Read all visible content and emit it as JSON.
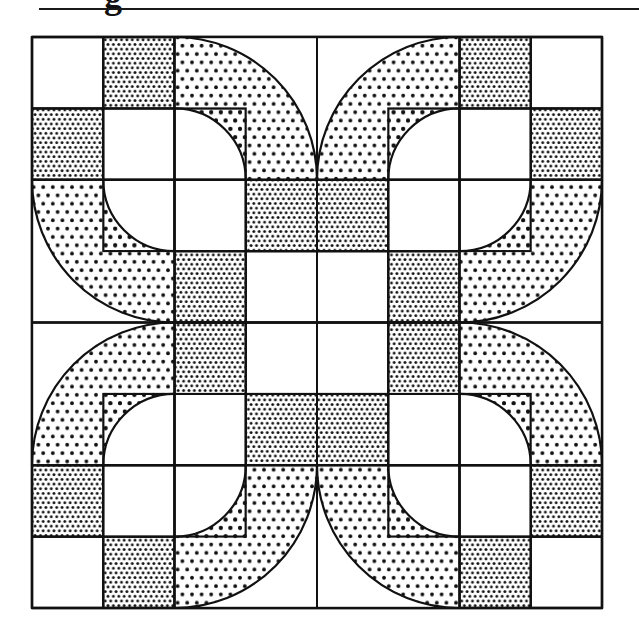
{
  "header": {
    "heading_fragment": "g",
    "rule_color": "#1a1a1a"
  },
  "quilt_block": {
    "description": "Drunkard's Path style quilt block, 8x8 grid with four dotted quarter-ring arcs pairs",
    "grid": {
      "rows": 8,
      "cols": 8,
      "left": 32,
      "top": 37,
      "right": 602,
      "bottom": 608
    },
    "colors": {
      "line": "#111111",
      "background": "#ffffff",
      "dot": "#111111"
    },
    "patterns": {
      "dense": {
        "spacing": 5.4,
        "radius": 1.45
      },
      "sparse": {
        "spacing": 9.6,
        "radius": 1.9
      }
    },
    "dense_cells": [
      [
        0,
        1
      ],
      [
        1,
        0
      ],
      [
        2,
        3
      ],
      [
        3,
        2
      ],
      [
        0,
        6
      ],
      [
        1,
        7
      ],
      [
        2,
        4
      ],
      [
        3,
        5
      ],
      [
        4,
        2
      ],
      [
        5,
        3
      ],
      [
        6,
        0
      ],
      [
        7,
        1
      ],
      [
        4,
        5
      ],
      [
        5,
        4
      ],
      [
        6,
        7
      ],
      [
        7,
        6
      ]
    ],
    "quadrants": [
      {
        "name": "top-left",
        "center": [
          2,
          2
        ],
        "bands": [
          "upper-right",
          "lower-left"
        ]
      },
      {
        "name": "top-right",
        "center": [
          6,
          2
        ],
        "bands": [
          "upper-left",
          "lower-right"
        ]
      },
      {
        "name": "bottom-left",
        "center": [
          2,
          6
        ],
        "bands": [
          "upper-left",
          "lower-right"
        ]
      },
      {
        "name": "bottom-right",
        "center": [
          6,
          6
        ],
        "bands": [
          "upper-right",
          "lower-left"
        ]
      }
    ],
    "ring": {
      "inner_radius_cells": 1,
      "outer_radius_cells": 2
    }
  }
}
